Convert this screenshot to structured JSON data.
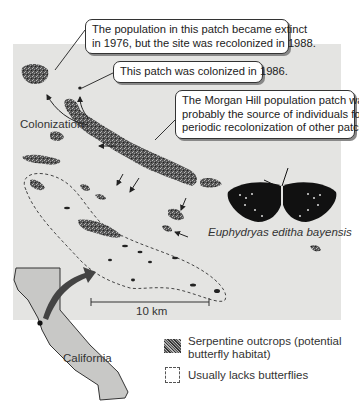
{
  "figure": {
    "callouts": [
      {
        "id": "extinct",
        "lines": [
          "The population in this patch became extinct",
          "in 1976, but the site was recolonized in 1988."
        ]
      },
      {
        "id": "colonized",
        "lines": [
          "This patch was colonized in 1986."
        ]
      },
      {
        "id": "morgan-hill",
        "lines": [
          "The Morgan Hill population patch was",
          "probably the source of individuals for",
          "periodic recolonization of other patches."
        ]
      }
    ],
    "labels": {
      "colonization": "Colonization",
      "species": "Euphydryas editha bayensis",
      "scale_bar": "10 km",
      "state": "California"
    },
    "legend": [
      {
        "symbol": "serpentine-swatch",
        "lines": [
          "Serpentine outcrops (potential",
          "butterfly habitat)"
        ]
      },
      {
        "symbol": "dashed-box",
        "lines": [
          "Usually lacks butterflies"
        ]
      }
    ],
    "colors": {
      "map_background": "#e4e4e2",
      "patch": "#4a4a4a",
      "california_fill": "#c8c8c6",
      "arrow": "#333333"
    }
  }
}
